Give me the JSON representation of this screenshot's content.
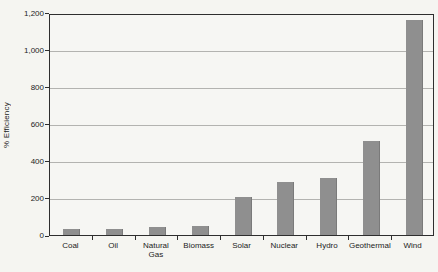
{
  "chart_data": {
    "type": "bar",
    "title": "",
    "xlabel": "",
    "ylabel": "% Efficiency",
    "categories": [
      "Coal",
      "Oil",
      "Natural\nGas",
      "Biomass",
      "Solar",
      "Nuclear",
      "Hydro",
      "Geothermal",
      "Wind"
    ],
    "values": [
      30,
      30,
      45,
      50,
      205,
      285,
      310,
      510,
      1160
    ],
    "ylim": [
      0,
      1200
    ],
    "ytick_step": 200,
    "ytick_labels": [
      "0",
      "200",
      "400",
      "600",
      "800",
      "1,000",
      "1,200"
    ],
    "grid": true,
    "legend": null,
    "colors": {
      "bar": "#8f8f8f",
      "bar_edge": "#7a7a7a",
      "gridline": "#b3b3b0",
      "axis": "#2e2e2e",
      "background": "#f5f5f1",
      "plot_background": "#f6f6f3",
      "text": "#1c1c1c"
    }
  }
}
